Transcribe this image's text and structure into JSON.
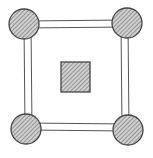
{
  "diagram": {
    "colors": {
      "background": "#ffffff",
      "stroke": "#444444",
      "fill": "#c8c8c8",
      "hatch": "#6a6a6a"
    },
    "nodes": [
      {
        "id": "top-left",
        "shape": "circle",
        "cx": 24,
        "cy": 24,
        "r": 15
      },
      {
        "id": "top-right",
        "shape": "circle",
        "cx": 127,
        "cy": 23,
        "r": 15
      },
      {
        "id": "bottom-left",
        "shape": "circle",
        "cx": 26,
        "cy": 129,
        "r": 15
      },
      {
        "id": "bottom-right",
        "shape": "circle",
        "cx": 128,
        "cy": 130,
        "r": 15
      }
    ],
    "center_block": {
      "shape": "square",
      "x": 61,
      "y": 62,
      "width": 29,
      "height": 30
    },
    "bars": [
      {
        "id": "top",
        "from": "top-left",
        "to": "top-right"
      },
      {
        "id": "right",
        "from": "top-right",
        "to": "bottom-right"
      },
      {
        "id": "bottom",
        "from": "bottom-left",
        "to": "bottom-right"
      },
      {
        "id": "left",
        "from": "top-left",
        "to": "bottom-left"
      }
    ]
  }
}
